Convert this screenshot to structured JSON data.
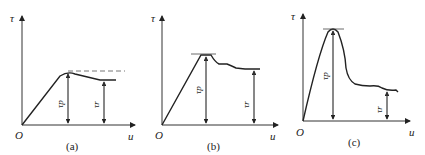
{
  "figure": {
    "panels": [
      {
        "caption": "(a)",
        "y_axis_label": "τ",
        "x_axis_label": "u",
        "origin_label": "O",
        "peak_label": "τp",
        "residual_label": "τr",
        "description": "Linear rise to peak, slight drop to residual plateau; dashed line marks peak level"
      },
      {
        "caption": "(b)",
        "y_axis_label": "τ",
        "x_axis_label": "u",
        "origin_label": "O",
        "peak_label": "τp",
        "residual_label": "τr",
        "description": "Rise to a flat-topped peak, stepped decline to residual"
      },
      {
        "caption": "(c)",
        "y_axis_label": "τ",
        "x_axis_label": "u",
        "origin_label": "O",
        "peak_label": "τp",
        "residual_label": "τr",
        "description": "Sharp peak followed by large drop to low residual"
      }
    ]
  }
}
